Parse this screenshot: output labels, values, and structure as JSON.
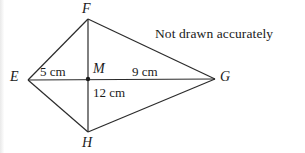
{
  "figure": {
    "type": "geometry-diagram",
    "shape": "kite",
    "note": "Not drawn accurately",
    "vertices": [
      {
        "name": "F",
        "label": "F",
        "x": 88,
        "y": 19,
        "label_x": 82,
        "label_y": 2
      },
      {
        "name": "E",
        "label": "E",
        "x": 28,
        "y": 80,
        "label_x": 10,
        "label_y": 70
      },
      {
        "name": "G",
        "label": "G",
        "x": 215,
        "y": 79,
        "label_x": 220,
        "label_y": 70
      },
      {
        "name": "H",
        "label": "H",
        "x": 88,
        "y": 132,
        "label_x": 82,
        "label_y": 136
      },
      {
        "name": "M",
        "label": "M",
        "x": 88,
        "y": 79,
        "label_x": 93,
        "label_y": 62
      }
    ],
    "edges": [
      {
        "name": "edge-EF",
        "from": "E",
        "to": "F"
      },
      {
        "name": "edge-FG",
        "from": "F",
        "to": "G"
      },
      {
        "name": "edge-GH",
        "from": "G",
        "to": "H"
      },
      {
        "name": "edge-HE",
        "from": "H",
        "to": "E"
      },
      {
        "name": "diagonal-EG",
        "from": "E",
        "to": "G"
      },
      {
        "name": "diagonal-FH",
        "from": "F",
        "to": "H"
      }
    ],
    "measurements": [
      {
        "name": "segment-EM",
        "text": "5 cm",
        "x": 40,
        "y": 65
      },
      {
        "name": "segment-MG",
        "text": "9 cm",
        "x": 132,
        "y": 65
      },
      {
        "name": "segment-MH",
        "text": "12 cm",
        "x": 93,
        "y": 86
      }
    ],
    "note_position": {
      "x": 155,
      "y": 27
    },
    "colors": {
      "stroke": "#2b2b2b",
      "text": "#1a1a1a",
      "background": "#ffffff"
    }
  }
}
